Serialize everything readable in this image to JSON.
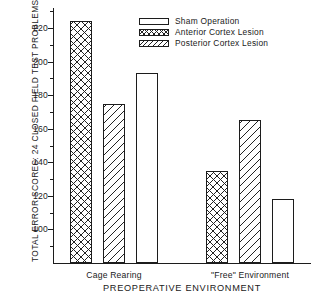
{
  "chart_data": {
    "type": "bar",
    "title": "",
    "xlabel": "PREOPERATIVE ENVIRONMENT",
    "ylabel": "TOTAL ERROR SCORES: 24 CLOSED FIELD TEST PROBLEMS",
    "categories": [
      "Cage Rearing",
      "\"Free\" Environment"
    ],
    "series": [
      {
        "name": "Sham Operation",
        "pattern": "plain",
        "values": [
          193,
          118
        ]
      },
      {
        "name": "Anterior Cortex Lesion",
        "pattern": "crosshatch",
        "values": [
          224,
          135
        ]
      },
      {
        "name": "Posterior Cortex Lesion",
        "pattern": "diagonal",
        "values": [
          175,
          165
        ]
      }
    ],
    "bar_order": [
      {
        "group": 0,
        "series": 1,
        "value": 224,
        "pattern": "crosshatch"
      },
      {
        "group": 0,
        "series": 2,
        "value": 175,
        "pattern": "diagonal"
      },
      {
        "group": 0,
        "series": 0,
        "value": 193,
        "pattern": "plain"
      },
      {
        "group": 1,
        "series": 1,
        "value": 135,
        "pattern": "crosshatch"
      },
      {
        "group": 1,
        "series": 2,
        "value": 165,
        "pattern": "diagonal"
      },
      {
        "group": 1,
        "series": 0,
        "value": 118,
        "pattern": "plain"
      }
    ],
    "ylim": [
      80,
      232
    ],
    "ytick_major": [
      100,
      120,
      140,
      160,
      180,
      200,
      220
    ],
    "ytick_minor": [
      90,
      110,
      130,
      150,
      170,
      190,
      210,
      230
    ],
    "ytick_labels": [
      "100",
      "120",
      "140",
      "160",
      "180",
      "200",
      "220"
    ],
    "grid": false,
    "legend_position": "top-right"
  },
  "legend": {
    "entries": [
      {
        "label": "Sham Operation",
        "pattern": "plain"
      },
      {
        "label": "Anterior Cortex Lesion",
        "pattern": "crosshatch"
      },
      {
        "label": "Posterior Cortex Lesion",
        "pattern": "diagonal"
      }
    ]
  },
  "axes": {
    "y_title": "TOTAL ERROR SCORES: 24 CLOSED FIELD TEST PROBLEMS",
    "x_title": "PREOPERATIVE ENVIRONMENT",
    "group_labels": [
      "Cage Rearing",
      "\"Free\" Environment"
    ]
  },
  "colors": {
    "ink": "#1c1c1c",
    "background": "#ffffff"
  }
}
